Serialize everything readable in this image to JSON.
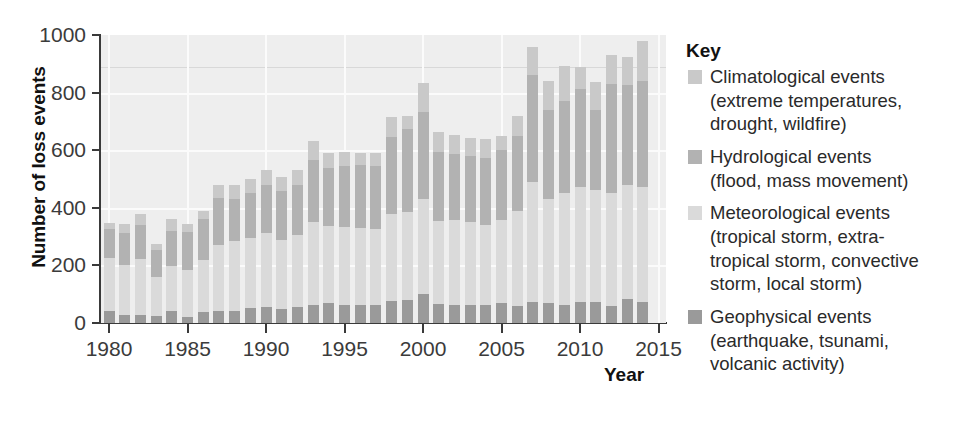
{
  "chart_data": {
    "type": "bar",
    "stacked": true,
    "title": "",
    "xlabel": "Year",
    "ylabel": "Number of loss events",
    "xlim": [
      1979.3,
      2015.3
    ],
    "ylim": [
      0,
      1000
    ],
    "ytick_step": 200,
    "yticks": [
      0,
      200,
      400,
      600,
      800,
      1000
    ],
    "xticks": [
      1980,
      1985,
      1990,
      1995,
      2000,
      2005,
      2010,
      2015
    ],
    "grid": true,
    "legend_position": "right",
    "categories": [
      1980,
      1981,
      1982,
      1983,
      1984,
      1985,
      1986,
      1987,
      1988,
      1989,
      1990,
      1991,
      1992,
      1993,
      1994,
      1995,
      1996,
      1997,
      1998,
      1999,
      2000,
      2001,
      2002,
      2003,
      2004,
      2005,
      2006,
      2007,
      2008,
      2009,
      2010,
      2011,
      2012,
      2013,
      2014
    ],
    "series": [
      {
        "name": "Geophysical events",
        "color": "#9a9a9a",
        "values": [
          40,
          27,
          28,
          25,
          43,
          22,
          37,
          40,
          42,
          52,
          56,
          50,
          55,
          62,
          68,
          63,
          62,
          62,
          77,
          80,
          102,
          66,
          64,
          62,
          62,
          68,
          58,
          72,
          70,
          63,
          72,
          73,
          60,
          82,
          72
        ]
      },
      {
        "name": "Meteorological events",
        "color": "#dadada",
        "values": [
          185,
          176,
          193,
          135,
          155,
          162,
          182,
          232,
          242,
          242,
          256,
          238,
          250,
          288,
          270,
          272,
          268,
          265,
          300,
          304,
          330,
          288,
          292,
          288,
          280,
          290,
          332,
          418,
          360,
          388,
          400,
          388,
          390,
          396,
          400
        ]
      },
      {
        "name": "Hydrological events",
        "color": "#b2b2b2",
        "values": [
          100,
          110,
          120,
          94,
          122,
          132,
          142,
          162,
          148,
          158,
          168,
          172,
          175,
          215,
          200,
          210,
          218,
          218,
          268,
          290,
          300,
          240,
          232,
          230,
          232,
          242,
          258,
          370,
          310,
          320,
          340,
          280,
          380,
          350,
          370
        ]
      },
      {
        "name": "Climatological events",
        "color": "#c9c9c9",
        "values": [
          22,
          32,
          37,
          22,
          42,
          28,
          29,
          46,
          48,
          48,
          50,
          46,
          52,
          66,
          52,
          48,
          42,
          46,
          70,
          46,
          100,
          70,
          66,
          64,
          66,
          50,
          72,
          100,
          100,
          120,
          76,
          96,
          100,
          94,
          138
        ]
      }
    ],
    "totals": [
      347,
      345,
      378,
      276,
      362,
      344,
      390,
      480,
      480,
      500,
      530,
      506,
      532,
      631,
      590,
      593,
      590,
      591,
      715,
      720,
      832,
      664,
      654,
      644,
      640,
      650,
      720,
      960,
      840,
      891,
      888,
      837,
      930,
      922,
      980
    ]
  },
  "axes": {
    "y_title": "Number of loss events",
    "x_title": "Year",
    "y_tick_labels": [
      "1000",
      "800",
      "600",
      "400",
      "200",
      "0"
    ],
    "x_tick_labels": [
      "1980",
      "1985",
      "1990",
      "1995",
      "2000",
      "2005",
      "2010",
      "2015"
    ]
  },
  "legend": {
    "title": "Key",
    "entries": [
      {
        "label": "Climatological events",
        "detail_line1": "(extreme temperatures,",
        "detail_line2": "drought, wildfire)",
        "detail_line3": "",
        "color": "#c9c9c9"
      },
      {
        "label": "Hydrological events",
        "detail_line1": "(flood, mass movement)",
        "detail_line2": "",
        "detail_line3": "",
        "color": "#b2b2b2"
      },
      {
        "label": "Meteorological events",
        "detail_line1": "(tropical storm, extra-",
        "detail_line2": "tropical storm, convective",
        "detail_line3": "storm, local storm)",
        "color": "#dadada"
      },
      {
        "label": "Geophysical events",
        "detail_line1": "(earthquake, tsunami,",
        "detail_line2": "volcanic activity)",
        "detail_line3": "",
        "color": "#9a9a9a"
      }
    ]
  }
}
